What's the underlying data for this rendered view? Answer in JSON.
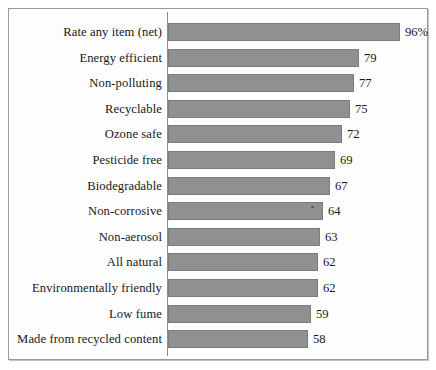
{
  "figure": {
    "frame_color": "#9a9a9a",
    "background_color": "#fdfdfd",
    "bar_color": "#8f9092",
    "axis_color": "#8c8c8c",
    "text_color": "#181818"
  },
  "chart_data": {
    "type": "bar",
    "orientation": "horizontal",
    "title": "",
    "subtitle": "",
    "xlabel": "",
    "ylabel": "",
    "xlim": [
      0,
      100
    ],
    "grid": false,
    "legend": false,
    "categories": [
      "Rate any item (net)",
      "Energy efficient",
      "Non-polluting",
      "Recyclable",
      "Ozone safe",
      "Pesticide free",
      "Biodegradable",
      "Non-corrosive",
      "Non-aerosol",
      "All natural",
      "Environmentally friendly",
      "Low fume",
      "Made from recycled content"
    ],
    "values": [
      96,
      79,
      77,
      75,
      72,
      69,
      67,
      64,
      63,
      62,
      62,
      59,
      58
    ],
    "value_labels": [
      "96%",
      "79",
      "77",
      "75",
      "72",
      "69",
      "67",
      "64",
      "63",
      "62",
      "62",
      "59",
      "58"
    ],
    "annotations": []
  }
}
